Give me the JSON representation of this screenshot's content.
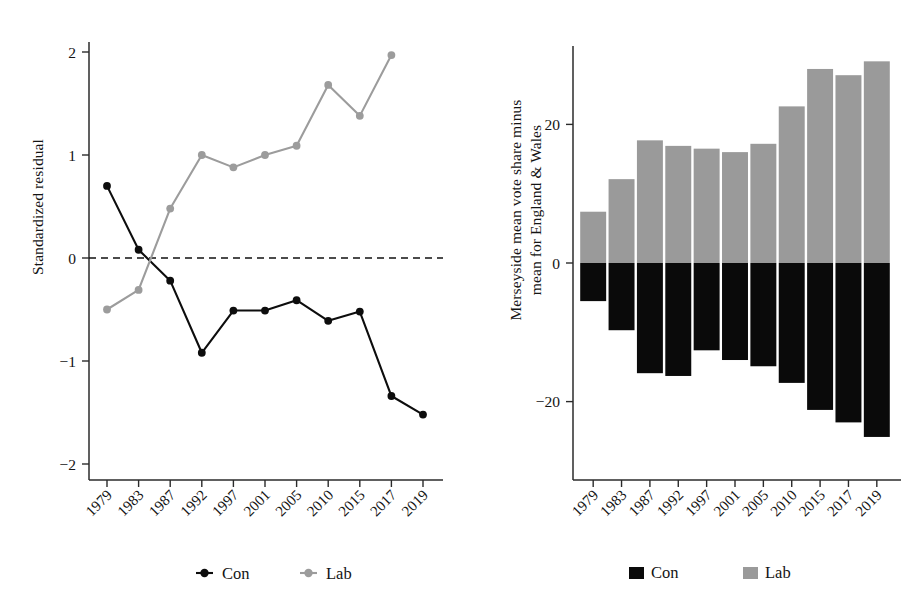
{
  "chart_data": [
    {
      "id": "left",
      "type": "line",
      "title": "",
      "xlabel": "",
      "ylabel": "Standardized residual",
      "categories": [
        "1979",
        "1983",
        "1987",
        "1992",
        "1997",
        "2001",
        "2005",
        "2010",
        "2015",
        "2017",
        "2019"
      ],
      "yticks": [
        2,
        1,
        0,
        -1,
        -2
      ],
      "ytick_labels": [
        "2",
        "1",
        "0",
        "−1",
        "−2"
      ],
      "ylim": [
        -2.3,
        2.2
      ],
      "grid": false,
      "zero_reference_line": 0,
      "legend_position": "bottom",
      "series": [
        {
          "name": "Con",
          "color": "#0d0d0d",
          "marker": "circle",
          "values": [
            0.7,
            0.08,
            -0.22,
            -0.92,
            -0.51,
            -0.51,
            -0.41,
            -0.61,
            -0.52,
            -1.34,
            -1.52
          ]
        },
        {
          "name": "Lab",
          "color": "#9c9c9c",
          "marker": "circle",
          "values": [
            -0.5,
            -0.31,
            0.48,
            1.0,
            0.88,
            1.0,
            1.09,
            1.68,
            1.38,
            1.97,
            null
          ]
        }
      ]
    },
    {
      "id": "right",
      "type": "bar",
      "title": "",
      "xlabel": "",
      "ylabel": "Merseyside mean vote share minus\nmean for England & Wales",
      "ylabel_line1": "Merseyside mean vote share minus",
      "ylabel_line2": "mean for England & Wales",
      "categories": [
        "1979",
        "1983",
        "1987",
        "1992",
        "1997",
        "2001",
        "2005",
        "2010",
        "2015",
        "2017",
        "2019"
      ],
      "yticks": [
        20,
        0,
        -20
      ],
      "ytick_labels": [
        "20",
        "0",
        "−20"
      ],
      "ylim": [
        -31,
        32
      ],
      "grid": false,
      "legend_position": "bottom",
      "series": [
        {
          "name": "Con",
          "color": "#0a0a0a",
          "values": [
            -5.5,
            -9.7,
            -15.9,
            -16.3,
            -12.6,
            -14.0,
            -14.9,
            -17.3,
            -21.2,
            -23.0,
            -25.1
          ]
        },
        {
          "name": "Lab",
          "color": "#9a9a9a",
          "values": [
            7.4,
            12.1,
            17.7,
            16.9,
            16.5,
            16.0,
            17.2,
            22.6,
            28.0,
            27.1,
            29.1
          ]
        }
      ]
    }
  ],
  "left_panel": {
    "ylabel": "Standardized residual",
    "ytick_labels": [
      "2",
      "1",
      "0",
      "−1",
      "−2"
    ],
    "xtick_labels": [
      "1979",
      "1983",
      "1987",
      "1992",
      "1997",
      "2001",
      "2005",
      "2010",
      "2015",
      "2017",
      "2019"
    ],
    "legend": [
      {
        "label": "Con",
        "marker": "line-dot-marker",
        "color": "#0d0d0d"
      },
      {
        "label": "Lab",
        "marker": "line-dot-marker",
        "color": "#9c9c9c"
      }
    ]
  },
  "right_panel": {
    "ylabel_line1": "Merseyside mean vote share minus",
    "ylabel_line2": "mean for England & Wales",
    "ytick_labels": [
      "20",
      "0",
      "−20"
    ],
    "xtick_labels": [
      "1979",
      "1983",
      "1987",
      "1992",
      "1997",
      "2001",
      "2005",
      "2010",
      "2015",
      "2017",
      "2019"
    ],
    "legend": [
      {
        "label": "Con",
        "marker": "square-swatch",
        "color": "#0a0a0a"
      },
      {
        "label": "Lab",
        "marker": "square-swatch",
        "color": "#9a9a9a"
      }
    ]
  }
}
